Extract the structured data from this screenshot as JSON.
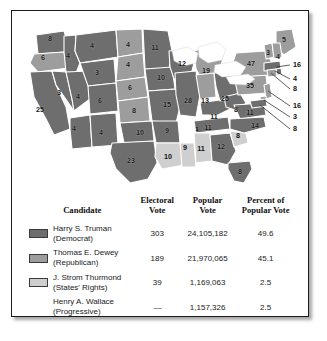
{
  "colors": {
    "truman": "#6e6e6e",
    "dewey": "#9d9d9d",
    "thurmond": "#cfcfcf",
    "wallace": "#ffffff",
    "border": "#ffffff",
    "water": "#ffffff",
    "frame": "#1c1c1c",
    "text": "#1a1a1a"
  },
  "map": {
    "name": "electoral-map-1948",
    "legend_order": [
      "truman",
      "dewey",
      "thurmond"
    ],
    "states": [
      {
        "code": "WA",
        "name": "Washington",
        "votes": "8",
        "party": "truman",
        "x": 38,
        "y": 30
      },
      {
        "code": "OR",
        "name": "Oregon",
        "votes": "6",
        "party": "dewey",
        "x": 31,
        "y": 49
      },
      {
        "code": "CA",
        "name": "California",
        "votes": "25",
        "party": "truman",
        "x": 28,
        "y": 101
      },
      {
        "code": "ID",
        "name": "Idaho",
        "votes": "4",
        "party": "truman",
        "x": 56,
        "y": 47
      },
      {
        "code": "NV",
        "name": "Nevada",
        "votes": "3",
        "party": "truman",
        "x": 47,
        "y": 84
      },
      {
        "code": "UT",
        "name": "Utah",
        "votes": "4",
        "party": "truman",
        "x": 66,
        "y": 88
      },
      {
        "code": "AZ",
        "name": "Arizona",
        "votes": "4",
        "party": "truman",
        "x": 62,
        "y": 120
      },
      {
        "code": "MT",
        "name": "Montana",
        "votes": "4",
        "party": "truman",
        "x": 80,
        "y": 37
      },
      {
        "code": "WY",
        "name": "Wyoming",
        "votes": "3",
        "party": "truman",
        "x": 85,
        "y": 64
      },
      {
        "code": "CO",
        "name": "Colorado",
        "votes": "6",
        "party": "truman",
        "x": 88,
        "y": 92
      },
      {
        "code": "NM",
        "name": "New Mexico",
        "votes": "4",
        "party": "truman",
        "x": 89,
        "y": 124
      },
      {
        "code": "ND",
        "name": "North Dakota",
        "votes": "4",
        "party": "dewey",
        "x": 116,
        "y": 36
      },
      {
        "code": "SD",
        "name": "South Dakota",
        "votes": "4",
        "party": "dewey",
        "x": 116,
        "y": 56
      },
      {
        "code": "NE",
        "name": "Nebraska",
        "votes": "6",
        "party": "dewey",
        "x": 118,
        "y": 79
      },
      {
        "code": "KS",
        "name": "Kansas",
        "votes": "8",
        "party": "dewey",
        "x": 122,
        "y": 102
      },
      {
        "code": "OK",
        "name": "Oklahoma",
        "votes": "10",
        "party": "truman",
        "x": 128,
        "y": 124
      },
      {
        "code": "TX",
        "name": "Texas",
        "votes": "23",
        "party": "truman",
        "x": 119,
        "y": 152
      },
      {
        "code": "MN",
        "name": "Minnesota",
        "votes": "11",
        "party": "truman",
        "x": 143,
        "y": 39
      },
      {
        "code": "IA",
        "name": "Iowa",
        "votes": "10",
        "party": "truman",
        "x": 149,
        "y": 69
      },
      {
        "code": "MO",
        "name": "Missouri",
        "votes": "15",
        "party": "truman",
        "x": 155,
        "y": 96
      },
      {
        "code": "AR",
        "name": "Arkansas",
        "votes": "9",
        "party": "truman",
        "x": 155,
        "y": 122
      },
      {
        "code": "LA",
        "name": "Louisiana",
        "votes": "10",
        "party": "thurmond",
        "x": 156,
        "y": 148
      },
      {
        "code": "WI",
        "name": "Wisconsin",
        "votes": "12",
        "party": "truman",
        "x": 170,
        "y": 55
      },
      {
        "code": "IL",
        "name": "Illinois",
        "votes": "28",
        "party": "truman",
        "x": 176,
        "y": 92
      },
      {
        "code": "MS",
        "name": "Mississippi",
        "votes": "9",
        "party": "thurmond",
        "x": 173,
        "y": 139
      },
      {
        "code": "MI",
        "name": "Michigan",
        "votes": "19",
        "party": "dewey",
        "x": 194,
        "y": 62
      },
      {
        "code": "IN",
        "name": "Indiana",
        "votes": "13",
        "party": "dewey",
        "x": 193,
        "y": 92
      },
      {
        "code": "TN",
        "name": "Tennessee",
        "votes": "11",
        "party": "truman",
        "x": 196,
        "y": 119
      },
      {
        "code": "TN1",
        "name": "Tennessee split",
        "votes": "1",
        "party": "thurmond",
        "x": 185,
        "y": 120
      },
      {
        "code": "AL",
        "name": "Alabama",
        "votes": "11",
        "party": "thurmond",
        "x": 189,
        "y": 140
      },
      {
        "code": "KY",
        "name": "Kentucky",
        "votes": "11",
        "party": "truman",
        "x": 202,
        "y": 108
      },
      {
        "code": "OH",
        "name": "Ohio",
        "votes": "25",
        "party": "truman",
        "x": 213,
        "y": 90
      },
      {
        "code": "GA",
        "name": "Georgia",
        "votes": "12",
        "party": "truman",
        "x": 209,
        "y": 138
      },
      {
        "code": "FL",
        "name": "Florida",
        "votes": "8",
        "party": "truman",
        "x": 228,
        "y": 163
      },
      {
        "code": "WV",
        "name": "West Virginia",
        "votes": "8",
        "party": "truman",
        "x": 224,
        "y": 101
      },
      {
        "code": "SC",
        "name": "South Carolina",
        "votes": "8",
        "party": "thurmond",
        "x": 226,
        "y": 127
      },
      {
        "code": "VA",
        "name": "Virginia",
        "votes": "11",
        "party": "truman",
        "x": 238,
        "y": 104
      },
      {
        "code": "NC",
        "name": "North Carolina",
        "votes": "14",
        "party": "truman",
        "x": 243,
        "y": 117
      },
      {
        "code": "PA",
        "name": "Pennsylvania",
        "votes": "35",
        "party": "dewey",
        "x": 238,
        "y": 77
      },
      {
        "code": "NY",
        "name": "New York",
        "votes": "47",
        "party": "dewey",
        "x": 239,
        "y": 55
      },
      {
        "code": "ME",
        "name": "Maine",
        "votes": "5",
        "party": "dewey",
        "x": 272,
        "y": 31
      },
      {
        "code": "VT",
        "name": "Vermont",
        "votes": "3",
        "party": "dewey",
        "x": 256,
        "y": 44
      },
      {
        "code": "NH",
        "name": "New Hampshire",
        "votes": "4",
        "party": "dewey",
        "x": 266,
        "y": 48
      }
    ],
    "callouts": [
      {
        "code": "MA",
        "name": "Massachusetts",
        "votes": "16",
        "party": "truman",
        "label_x": 281,
        "label_y": 54,
        "tip_x": 264,
        "tip_y": 56
      },
      {
        "code": "RI",
        "name": "Rhode Island",
        "votes": "4",
        "party": "truman",
        "label_x": 281,
        "label_y": 68,
        "tip_x": 263,
        "tip_y": 60
      },
      {
        "code": "CT",
        "name": "Connecticut",
        "votes": "8",
        "party": "dewey",
        "label_x": 281,
        "label_y": 78,
        "tip_x": 259,
        "tip_y": 62
      },
      {
        "code": "NJ",
        "name": "New Jersey",
        "votes": "16",
        "party": "dewey",
        "label_x": 281,
        "label_y": 95,
        "tip_x": 256,
        "tip_y": 80
      },
      {
        "code": "DE",
        "name": "Delaware",
        "votes": "3",
        "party": "dewey",
        "label_x": 281,
        "label_y": 106,
        "tip_x": 252,
        "tip_y": 89
      },
      {
        "code": "MD",
        "name": "Maryland",
        "votes": "8",
        "party": "truman",
        "label_x": 281,
        "label_y": 118,
        "tip_x": 248,
        "tip_y": 94
      }
    ]
  },
  "table": {
    "headers": {
      "candidate": "Candidate",
      "electoral_vote_l1": "Electoral",
      "electoral_vote_l2": "Vote",
      "popular_vote_l1": "Popular",
      "popular_vote_l2": "Vote",
      "percent_l1": "Percent of",
      "percent_l2": "Popular Vote"
    },
    "rows": [
      {
        "name": "Harry S. Truman",
        "party": "(Democrat)",
        "swatch": "truman",
        "electoral_vote": "303",
        "popular_vote": "24,105,182",
        "percent": "49.6"
      },
      {
        "name": "Thomas E. Dewey",
        "party": "(Republican)",
        "swatch": "dewey",
        "electoral_vote": "189",
        "popular_vote": "21,970,065",
        "percent": "45.1"
      },
      {
        "name": "J. Strom Thurmond",
        "party": "(States' Rights)",
        "swatch": "thurmond",
        "electoral_vote": "39",
        "popular_vote": "1,169,063",
        "percent": "2.5"
      },
      {
        "name": "Henry A. Wallace",
        "party": "(Progressive)",
        "swatch": "none",
        "electoral_vote": "—",
        "popular_vote": "1,157,326",
        "percent": "2.5"
      }
    ]
  }
}
